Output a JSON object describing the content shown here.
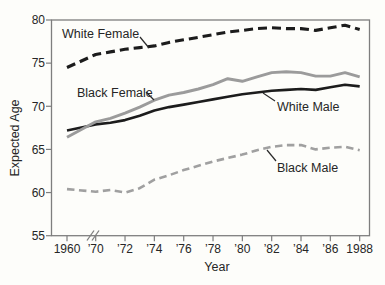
{
  "figure": {
    "title": "",
    "background": "#fdfdfa",
    "axis_color": "#7e7e7e",
    "text_color": "#262626"
  },
  "chart_data": {
    "type": "line",
    "title": "",
    "xlabel": "Year",
    "ylabel": "Expected Age",
    "ylim": [
      55,
      80
    ],
    "yticks": [
      55,
      60,
      65,
      70,
      75,
      80
    ],
    "x_axis_break": "scale break between 1960 and 1970",
    "xticks": [
      {
        "year": 1960,
        "label": "1960"
      },
      {
        "year": 1970,
        "label": "’70"
      },
      {
        "year": 1972,
        "label": "’72"
      },
      {
        "year": 1974,
        "label": "’74"
      },
      {
        "year": 1976,
        "label": "’76"
      },
      {
        "year": 1978,
        "label": "’78"
      },
      {
        "year": 1980,
        "label": "’80"
      },
      {
        "year": 1982,
        "label": "’82"
      },
      {
        "year": 1984,
        "label": "’84"
      },
      {
        "year": 1986,
        "label": "’86"
      },
      {
        "year": 1988,
        "label": "1988"
      }
    ],
    "x": [
      1960,
      1970,
      1971,
      1972,
      1973,
      1974,
      1975,
      1976,
      1977,
      1978,
      1979,
      1980,
      1981,
      1982,
      1983,
      1984,
      1985,
      1986,
      1987,
      1988
    ],
    "series": [
      {
        "name": "White Female",
        "style": "dashed",
        "color": "#1c1c1c",
        "width": 3.1,
        "dash": "9 5",
        "values": [
          74.5,
          76.0,
          76.3,
          76.6,
          76.8,
          77.0,
          77.4,
          77.7,
          78.0,
          78.3,
          78.6,
          78.8,
          79.0,
          79.1,
          79.0,
          79.0,
          78.8,
          79.1,
          79.4,
          78.9
        ]
      },
      {
        "name": "Black Female",
        "style": "solid",
        "color": "#9b9b9b",
        "width": 2.9,
        "dash": "",
        "values": [
          66.4,
          68.2,
          68.6,
          69.2,
          69.9,
          70.7,
          71.3,
          71.6,
          72.0,
          72.5,
          73.2,
          72.9,
          73.4,
          73.9,
          74.0,
          73.9,
          73.5,
          73.5,
          73.9,
          73.4
        ]
      },
      {
        "name": "White Male",
        "style": "solid",
        "color": "#1c1c1c",
        "width": 2.6,
        "dash": "",
        "values": [
          67.2,
          67.9,
          68.1,
          68.4,
          68.9,
          69.5,
          69.9,
          70.2,
          70.5,
          70.8,
          71.1,
          71.4,
          71.6,
          71.8,
          71.9,
          72.0,
          71.9,
          72.2,
          72.5,
          72.3
        ]
      },
      {
        "name": "Black Male",
        "style": "dashed",
        "color": "#a0a0a0",
        "width": 2.6,
        "dash": "7.5 4.5",
        "values": [
          60.4,
          60.1,
          60.3,
          60.0,
          60.5,
          61.5,
          62.0,
          62.6,
          63.1,
          63.6,
          64.0,
          64.4,
          64.9,
          65.3,
          65.5,
          65.5,
          65.0,
          65.2,
          65.3,
          64.9
        ]
      }
    ],
    "annotations": [
      {
        "text": "White Female",
        "x": 62,
        "y": 38,
        "pointer": [
          [
            140,
            37
          ],
          [
            149,
            48
          ]
        ]
      },
      {
        "text": "Black Female",
        "x": 77,
        "y": 97,
        "pointer": [
          [
            146,
            92
          ],
          [
            154,
            100
          ]
        ]
      },
      {
        "text": "White Male",
        "x": 277,
        "y": 111,
        "pointer": [
          [
            275,
            101
          ],
          [
            263,
            93
          ]
        ]
      },
      {
        "text": "Black Male",
        "x": 277,
        "y": 172,
        "pointer": [
          [
            276,
            161
          ],
          [
            267,
            150
          ]
        ]
      }
    ]
  }
}
